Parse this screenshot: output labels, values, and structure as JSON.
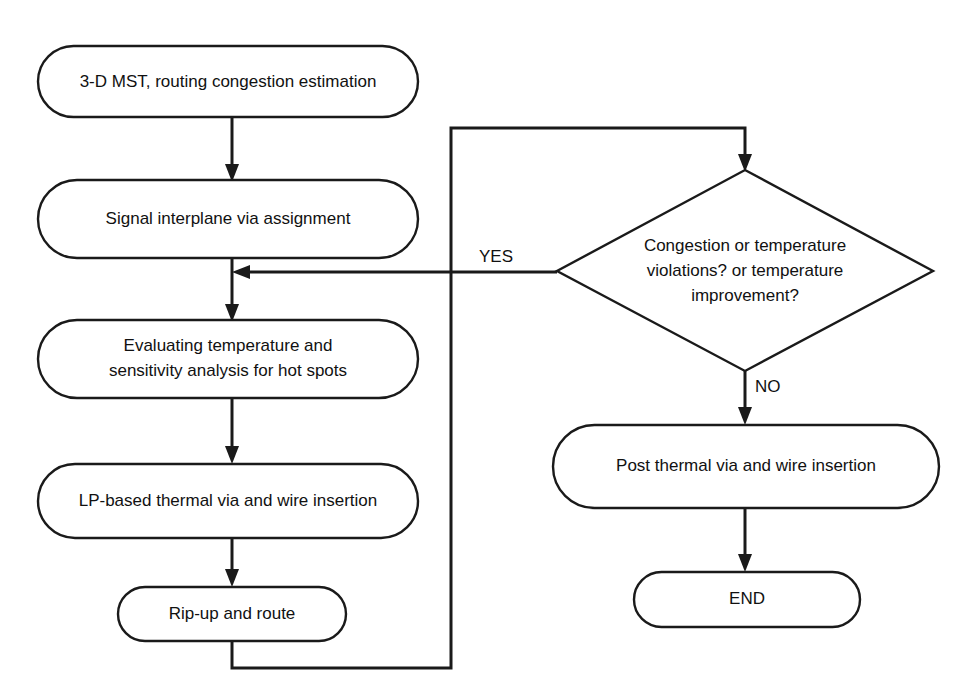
{
  "diagram": {
    "width": 963,
    "height": 700,
    "background_color": "#ffffff",
    "line_color": "#1a1a1a",
    "text_color": "#111111"
  },
  "nodes": {
    "start_mst": {
      "id": "start_mst",
      "shape": "stadium",
      "label": "3-D MST, routing congestion estimation",
      "lines": [
        "3-D MST, routing congestion estimation"
      ]
    },
    "signal_interplane": {
      "id": "signal_interplane",
      "shape": "stadium",
      "label": "Signal interplane via assignment",
      "lines": [
        "Signal interplane via assignment"
      ]
    },
    "evaluating": {
      "id": "evaluating",
      "shape": "stadium",
      "label": "Evaluating temperature and sensitivity analysis for hot spots",
      "lines": [
        "Evaluating temperature and",
        "sensitivity analysis for hot spots"
      ]
    },
    "lp_based": {
      "id": "lp_based",
      "shape": "stadium",
      "label": "LP-based thermal via and wire insertion",
      "lines": [
        "LP-based thermal via and wire insertion"
      ]
    },
    "rip_up": {
      "id": "rip_up",
      "shape": "stadium",
      "label": "Rip-up and route",
      "lines": [
        "Rip-up and route"
      ]
    },
    "decision": {
      "id": "decision",
      "shape": "diamond",
      "label": "Congestion or temperature violations? or temperature improvement?",
      "lines": [
        "Congestion or temperature",
        "violations? or temperature",
        "improvement?"
      ]
    },
    "post_thermal": {
      "id": "post_thermal",
      "shape": "stadium",
      "label": "Post thermal via and wire insertion",
      "lines": [
        "Post thermal via and wire insertion"
      ]
    },
    "end": {
      "id": "end",
      "shape": "stadium",
      "label": "END",
      "lines": [
        "END"
      ]
    }
  },
  "edge_labels": {
    "yes": "YES",
    "no": "NO"
  },
  "edges": [
    {
      "from": "start_mst",
      "to": "signal_interplane",
      "label": ""
    },
    {
      "from": "signal_interplane",
      "to": "evaluating",
      "label": ""
    },
    {
      "from": "evaluating",
      "to": "lp_based",
      "label": ""
    },
    {
      "from": "lp_based",
      "to": "rip_up",
      "label": ""
    },
    {
      "from": "rip_up",
      "to": "decision",
      "label": ""
    },
    {
      "from": "decision",
      "to": "evaluating",
      "label": "YES"
    },
    {
      "from": "decision",
      "to": "post_thermal",
      "label": "NO"
    },
    {
      "from": "post_thermal",
      "to": "end",
      "label": ""
    }
  ]
}
